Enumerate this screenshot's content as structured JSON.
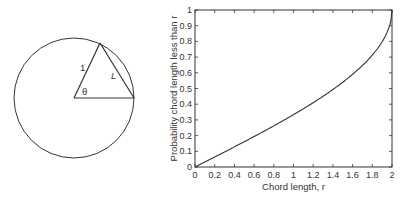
{
  "diagram": {
    "radius_label": "1",
    "angle_label": "θ",
    "chord_label": "L"
  },
  "chart_data": {
    "type": "line",
    "title": "",
    "xlabel": "Chord length, r",
    "ylabel": "Probability chord length less than r",
    "xlim": [
      0,
      2
    ],
    "ylim": [
      0,
      1
    ],
    "xticks": [
      "0",
      "0.2",
      "0.4",
      "0.6",
      "0.8",
      "1",
      "1.2",
      "1.4",
      "1.6",
      "1.8",
      "2"
    ],
    "yticks": [
      "0",
      "0.1",
      "0.2",
      "0.3",
      "0.4",
      "0.5",
      "0.6",
      "0.7",
      "0.8",
      "0.9",
      "1"
    ],
    "grid": false,
    "legend": null,
    "series": [
      {
        "name": "P(L < r) = (2/π)·arcsin(r/2)",
        "x": [
          0,
          0.2,
          0.4,
          0.6,
          0.8,
          1.0,
          1.2,
          1.4,
          1.6,
          1.8,
          1.9,
          1.95,
          2.0
        ],
        "y": [
          0,
          0.064,
          0.128,
          0.194,
          0.262,
          0.333,
          0.41,
          0.494,
          0.59,
          0.713,
          0.798,
          0.857,
          1.0
        ]
      }
    ]
  }
}
